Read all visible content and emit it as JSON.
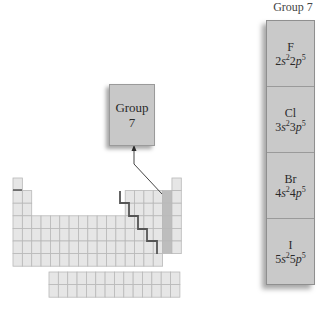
{
  "callout": {
    "line1": "Group",
    "line2": "7"
  },
  "group_column": {
    "header": "Group 7",
    "elements": [
      {
        "symbol": "F",
        "n": "2",
        "config": "2s²2p⁵"
      },
      {
        "symbol": "Cl",
        "n": "3",
        "config": "3s²3p⁵"
      },
      {
        "symbol": "Br",
        "n": "4",
        "config": "4s²4p⁵"
      },
      {
        "symbol": "I",
        "n": "5",
        "config": "5s²5p⁵"
      }
    ]
  },
  "colors": {
    "cell_fill": "#e6e6e6",
    "cell_line": "#b5b5b5",
    "group_fill": "#c9c9c9",
    "staircase": "#555555",
    "highlight": "#bdbdbd"
  }
}
